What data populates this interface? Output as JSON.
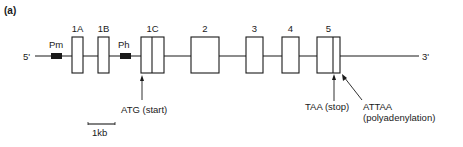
{
  "panel_label": "(a)",
  "ends": {
    "five_prime": "5'",
    "three_prime": "3'"
  },
  "promoters": [
    {
      "label": "Pm",
      "x": 51,
      "w": 11
    },
    {
      "label": "Ph",
      "x": 120,
      "w": 11
    }
  ],
  "exons": [
    {
      "label": "1A",
      "x": 72,
      "w": 11,
      "divider": null
    },
    {
      "label": "1B",
      "x": 98,
      "w": 11,
      "divider": null
    },
    {
      "label": "1C",
      "x": 141,
      "w": 23,
      "divider": 152
    },
    {
      "label": "2",
      "x": 191,
      "w": 28,
      "divider": null
    },
    {
      "label": "3",
      "x": 246,
      "w": 17,
      "divider": null
    },
    {
      "label": "4",
      "x": 282,
      "w": 17,
      "divider": null
    },
    {
      "label": "5",
      "x": 317,
      "w": 23,
      "divider": 333
    }
  ],
  "annotations": {
    "start": "ATG (start)",
    "stop": "TAA (stop)",
    "polyA_line1": "ATTAA",
    "polyA_line2": "(polyadenylation)"
  },
  "scale_bar": {
    "label": "1kb"
  },
  "colors": {
    "ink": "#1a1a1a",
    "background": "#ffffff"
  }
}
